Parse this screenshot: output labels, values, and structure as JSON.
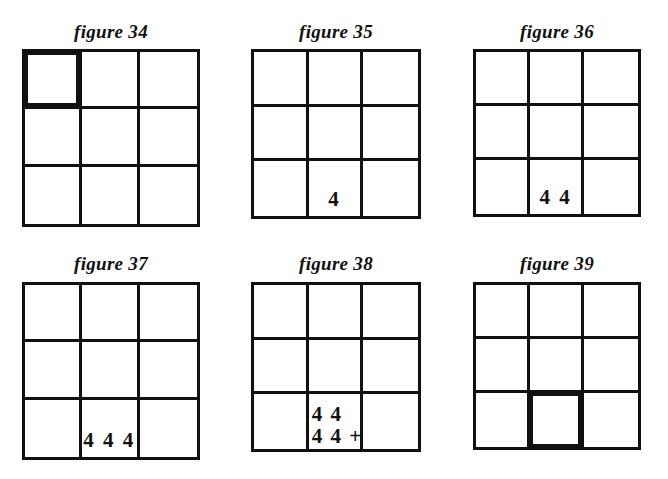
{
  "page": {
    "background_color": "#ffffff",
    "ink_color": "#111111"
  },
  "figures": [
    {
      "caption": "figure 34",
      "caption_left": 22,
      "caption_top": 22,
      "caption_width": 178,
      "grid_left": 22,
      "grid_top": 52,
      "grid_size": 178,
      "highlight_cell": 0,
      "cells": [
        {
          "index": 0,
          "text": "",
          "style": "centered"
        },
        {
          "index": 1,
          "text": "",
          "style": "centered"
        },
        {
          "index": 2,
          "text": "",
          "style": "centered"
        },
        {
          "index": 3,
          "text": "",
          "style": "centered"
        },
        {
          "index": 4,
          "text": "",
          "style": "centered"
        },
        {
          "index": 5,
          "text": "",
          "style": "centered"
        },
        {
          "index": 6,
          "text": "",
          "style": "centered"
        },
        {
          "index": 7,
          "text": "",
          "style": "centered"
        },
        {
          "index": 8,
          "text": "",
          "style": "centered"
        }
      ]
    },
    {
      "caption": "figure 35",
      "caption_left": 251,
      "caption_top": 22,
      "caption_width": 170,
      "grid_left": 251,
      "grid_top": 52,
      "grid_size": 170,
      "highlight_cell": null,
      "cells": [
        {
          "index": 0,
          "text": "",
          "style": "centered"
        },
        {
          "index": 1,
          "text": "",
          "style": "centered"
        },
        {
          "index": 2,
          "text": "",
          "style": "centered"
        },
        {
          "index": 3,
          "text": "",
          "style": "centered"
        },
        {
          "index": 4,
          "text": "",
          "style": "centered"
        },
        {
          "index": 5,
          "text": "",
          "style": "centered"
        },
        {
          "index": 6,
          "text": "",
          "style": "centered"
        },
        {
          "index": 7,
          "text": "4",
          "style": "centered"
        },
        {
          "index": 8,
          "text": "",
          "style": "centered"
        }
      ]
    },
    {
      "caption": "figure 36",
      "caption_left": 473,
      "caption_top": 22,
      "caption_width": 168,
      "grid_left": 473,
      "grid_top": 52,
      "grid_size": 168,
      "highlight_cell": null,
      "cells": [
        {
          "index": 0,
          "text": "",
          "style": "centered"
        },
        {
          "index": 1,
          "text": "",
          "style": "centered"
        },
        {
          "index": 2,
          "text": "",
          "style": "centered"
        },
        {
          "index": 3,
          "text": "",
          "style": "centered"
        },
        {
          "index": 4,
          "text": "",
          "style": "centered"
        },
        {
          "index": 5,
          "text": "",
          "style": "centered"
        },
        {
          "index": 6,
          "text": "",
          "style": "centered"
        },
        {
          "index": 7,
          "text": "4 4",
          "style": "centered"
        },
        {
          "index": 8,
          "text": "",
          "style": "centered"
        }
      ]
    },
    {
      "caption": "figure 37",
      "caption_left": 22,
      "caption_top": 254,
      "caption_width": 178,
      "grid_left": 22,
      "grid_top": 285,
      "grid_size": 178,
      "highlight_cell": null,
      "cells": [
        {
          "index": 0,
          "text": "",
          "style": "centered"
        },
        {
          "index": 1,
          "text": "",
          "style": "centered"
        },
        {
          "index": 2,
          "text": "",
          "style": "centered"
        },
        {
          "index": 3,
          "text": "",
          "style": "centered"
        },
        {
          "index": 4,
          "text": "",
          "style": "centered"
        },
        {
          "index": 5,
          "text": "",
          "style": "centered"
        },
        {
          "index": 6,
          "text": "",
          "style": "centered"
        },
        {
          "index": 7,
          "text": "4 4 4",
          "style": "overflow"
        },
        {
          "index": 8,
          "text": "",
          "style": "centered"
        }
      ]
    },
    {
      "caption": "figure 38",
      "caption_left": 251,
      "caption_top": 254,
      "caption_width": 170,
      "grid_left": 251,
      "grid_top": 285,
      "grid_size": 170,
      "highlight_cell": null,
      "cells": [
        {
          "index": 0,
          "text": "",
          "style": "centered"
        },
        {
          "index": 1,
          "text": "",
          "style": "centered"
        },
        {
          "index": 2,
          "text": "",
          "style": "centered"
        },
        {
          "index": 3,
          "text": "",
          "style": "centered"
        },
        {
          "index": 4,
          "text": "",
          "style": "centered"
        },
        {
          "index": 5,
          "text": "",
          "style": "centered"
        },
        {
          "index": 6,
          "text": "",
          "style": "centered"
        },
        {
          "index": 7,
          "text": "",
          "style": "two-line",
          "lines": [
            "4 4",
            "4 4 +"
          ]
        },
        {
          "index": 8,
          "text": "",
          "style": "centered"
        }
      ]
    },
    {
      "caption": "figure 39",
      "caption_left": 473,
      "caption_top": 254,
      "caption_width": 168,
      "grid_left": 473,
      "grid_top": 285,
      "grid_size": 168,
      "highlight_cell": 7,
      "cells": [
        {
          "index": 0,
          "text": "",
          "style": "centered"
        },
        {
          "index": 1,
          "text": "",
          "style": "centered"
        },
        {
          "index": 2,
          "text": "",
          "style": "centered"
        },
        {
          "index": 3,
          "text": "",
          "style": "centered"
        },
        {
          "index": 4,
          "text": "",
          "style": "centered"
        },
        {
          "index": 5,
          "text": "",
          "style": "centered"
        },
        {
          "index": 6,
          "text": "",
          "style": "centered"
        },
        {
          "index": 7,
          "text": "",
          "style": "centered"
        },
        {
          "index": 8,
          "text": "",
          "style": "centered"
        }
      ]
    }
  ]
}
